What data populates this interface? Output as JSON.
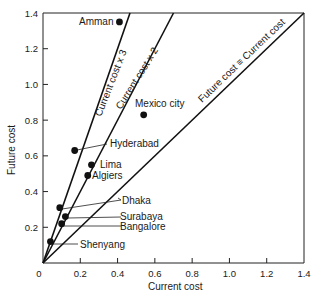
{
  "chart_data": {
    "type": "scatter",
    "title": "",
    "xlabel": "Current cost",
    "ylabel": "Future cost",
    "xlim": [
      0,
      1.4
    ],
    "ylim": [
      0,
      1.4
    ],
    "grid": false,
    "x_ticks": [
      0,
      0.2,
      0.4,
      0.6,
      0.8,
      1.0,
      1.2,
      1.4
    ],
    "x_tick_labels": [
      "0",
      "0.2",
      "0.4",
      "0.6",
      "0.8",
      "1.0",
      "1.2",
      "1.4"
    ],
    "y_ticks": [
      0.2,
      0.4,
      0.6,
      0.8,
      1.0,
      1.2,
      1.4
    ],
    "y_tick_labels": [
      "0.2",
      "0.4",
      "0.6",
      "0.8",
      "1.0",
      "1.2",
      "1.4"
    ],
    "points": [
      {
        "name": "Amman",
        "x": 0.41,
        "y": 1.35
      },
      {
        "name": "Mexico city",
        "x": 0.54,
        "y": 0.83
      },
      {
        "name": "Hyderabad",
        "x": 0.17,
        "y": 0.63
      },
      {
        "name": "Lima",
        "x": 0.26,
        "y": 0.55
      },
      {
        "name": "Algiers",
        "x": 0.24,
        "y": 0.49
      },
      {
        "name": "Dhaka",
        "x": 0.09,
        "y": 0.31
      },
      {
        "name": "Surabaya",
        "x": 0.12,
        "y": 0.26
      },
      {
        "name": "Bangalore",
        "x": 0.1,
        "y": 0.22
      },
      {
        "name": "Shenyang",
        "x": 0.04,
        "y": 0.12
      }
    ],
    "reference_lines": [
      {
        "label": "Current cost x 3",
        "slope": 3
      },
      {
        "label": "Current cost x 2",
        "slope": 2
      },
      {
        "label": "Future cost = Current cost",
        "slope": 1
      }
    ]
  },
  "labels": {
    "x_axis_title": "Current cost",
    "y_axis_title": "Future cost",
    "line_x3": "Current cost x 3",
    "line_x2": "Current cost x 2",
    "line_x1": "Future cost ≡ Current cost",
    "amman": "Amman",
    "mexico": "Mexico city",
    "hyderabad": "Hyderabad",
    "lima": "Lima",
    "algiers": "Algiers",
    "dhaka": "Dhaka",
    "surabaya": "Surabaya",
    "bangalore": "Bangalore",
    "shenyang": "Shenyang"
  }
}
